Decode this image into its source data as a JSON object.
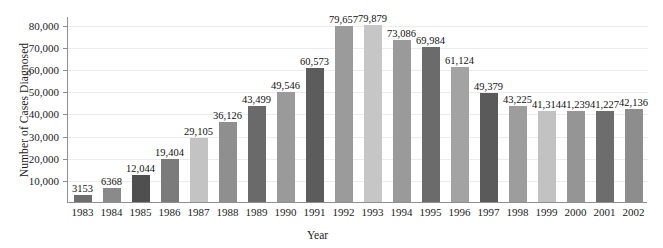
{
  "chart_data": {
    "type": "bar",
    "title": "",
    "xlabel": "Year",
    "ylabel": "Number of Cases Diagnosed",
    "ylim": [
      0,
      84000
    ],
    "yticks": [
      10000,
      20000,
      30000,
      40000,
      50000,
      60000,
      70000,
      80000
    ],
    "ytick_labels": [
      "10,000",
      "20,000",
      "30,000",
      "40,000",
      "50,000",
      "60,000",
      "70,000",
      "80,000"
    ],
    "grid": true,
    "legend": "none",
    "categories": [
      "1983",
      "1984",
      "1985",
      "1986",
      "1987",
      "1988",
      "1989",
      "1990",
      "1991",
      "1992",
      "1993",
      "1994",
      "1995",
      "1996",
      "1997",
      "1998",
      "1999",
      "2000",
      "2001",
      "2002"
    ],
    "values": [
      3153,
      6368,
      12044,
      19404,
      29105,
      36126,
      43499,
      49546,
      60573,
      79657,
      79879,
      73086,
      69984,
      61124,
      49379,
      43225,
      41314,
      41239,
      41227,
      42136
    ],
    "data_labels": [
      "3153",
      "6368",
      "12,044",
      "19,404",
      "29,105",
      "36,126",
      "43,499",
      "49,546",
      "60,573",
      "79,657",
      "79,879",
      "73,086",
      "69,984",
      "61,124",
      "49,379",
      "43,225",
      "41,314",
      "41,239",
      "41,227",
      "42,136"
    ],
    "bar_colors": [
      "#6e6e6e",
      "#8a8a8a",
      "#4f4f4f",
      "#7b7b7b",
      "#c3c3c3",
      "#8f8f8f",
      "#6a6a6a",
      "#9a9a9a",
      "#5c5c5c",
      "#9b9b9b",
      "#c6c6c6",
      "#9a9a9a",
      "#6b6b6b",
      "#a3a3a3",
      "#5a5a5a",
      "#9d9d9d",
      "#c2c2c2",
      "#959595",
      "#6d6d6d",
      "#8d8d8d"
    ],
    "axis_color": "#8f8f8f",
    "grid_color": "#ececec",
    "background": "#ffffff"
  }
}
